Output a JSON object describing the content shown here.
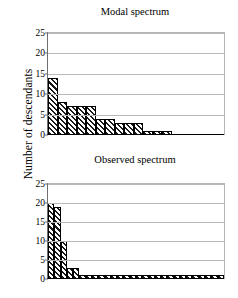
{
  "figure": {
    "ylabel": "Number of descendants",
    "background": "#ffffff",
    "bar_fill": "#1a1a1a",
    "grid_color": "#b9b9b9"
  },
  "chart_data": [
    {
      "type": "bar",
      "title": "Modal spectrum",
      "xlabel": "",
      "ylabel": "Number of descendants",
      "ylim": [
        0,
        25
      ],
      "yticks": [
        0,
        5,
        10,
        15,
        20,
        25
      ],
      "grid": true,
      "legend": "none",
      "categories": [
        "1",
        "2",
        "3",
        "4",
        "5",
        "6",
        "7",
        "8",
        "9",
        "10",
        "11",
        "12",
        "13"
      ],
      "values": [
        14,
        8,
        7,
        7,
        7,
        4,
        4,
        3,
        3,
        3,
        1,
        1,
        1
      ]
    },
    {
      "type": "bar",
      "title": "Observed spectrum",
      "xlabel": "",
      "ylabel": "Number of descendants",
      "ylim": [
        0,
        25
      ],
      "yticks": [
        0,
        5,
        10,
        15,
        20,
        25
      ],
      "grid": true,
      "legend": "none",
      "categories": [
        "1",
        "2",
        "3",
        "4",
        "5",
        "6",
        "7",
        "8",
        "9",
        "10",
        "11",
        "12",
        "13",
        "14",
        "15",
        "16",
        "17",
        "18",
        "19",
        "20",
        "21",
        "22",
        "23",
        "24",
        "25",
        "26",
        "27",
        "28"
      ],
      "values": [
        20,
        19,
        10,
        3,
        3,
        1,
        1,
        1,
        1,
        1,
        1,
        1,
        1,
        1,
        1,
        1,
        1,
        1,
        1,
        1,
        1,
        1,
        1,
        1,
        1,
        1,
        1,
        1
      ]
    }
  ]
}
